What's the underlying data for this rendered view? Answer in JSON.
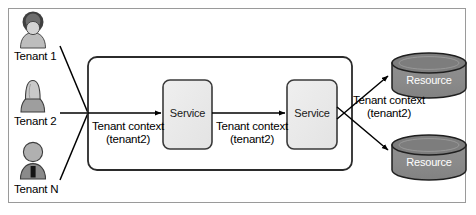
{
  "diagram": {
    "outer_frame": {
      "border_color": "#9a9a9a"
    },
    "tenants": [
      {
        "label": "Tenant 1",
        "icon": "person-avatar-icon",
        "head_color": "#3f3f3f",
        "body_color": "#bdbdbd"
      },
      {
        "label": "Tenant 2",
        "icon": "person-avatar-icon",
        "head_color": "#c9c9c9",
        "body_color": "#9e9e9e"
      },
      {
        "label": "Tenant N",
        "icon": "person-avatar-icon",
        "head_color": "#b0b0b0",
        "body_color": "#8a8a8a"
      }
    ],
    "services": [
      {
        "label": "Service",
        "fill": "#ececec",
        "stroke": "#3a3a3a"
      },
      {
        "label": "Service",
        "fill": "#ececec",
        "stroke": "#3a3a3a"
      }
    ],
    "resources": [
      {
        "label": "Resource",
        "icon": "database-cylinder-icon",
        "fill": "#8d8d8d",
        "top_fill": "#7a7a7a",
        "text_color": "#ffffff"
      },
      {
        "label": "Resource",
        "icon": "database-cylinder-icon",
        "fill": "#8d8d8d",
        "top_fill": "#7a7a7a",
        "text_color": "#ffffff"
      }
    ],
    "context_labels": [
      {
        "line1": "Tenant context",
        "line2": "(tenant2)"
      },
      {
        "line1": "Tenant context",
        "line2": "(tenant2)"
      },
      {
        "line1": "Tenant context",
        "line2": "(tenant2)"
      }
    ],
    "boundary": {
      "stroke": "#2b2b2b",
      "fill": "#ffffff",
      "shape": "rounded-rectangle"
    },
    "arrows": {
      "stroke": "#000000",
      "head": "filled-triangle"
    }
  }
}
